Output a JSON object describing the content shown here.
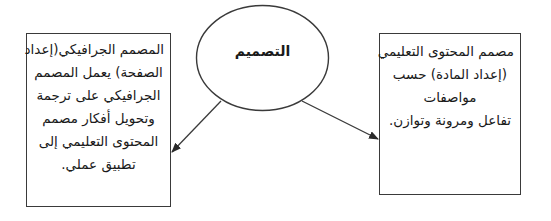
{
  "diagram": {
    "center_node": {
      "label": "التصميم",
      "shape": "ellipse"
    },
    "left_node": {
      "shape": "rectangle",
      "lines": [
        "المصمم الجرافيكي(إعداد",
        "الصفحة) يعمل المصمم",
        "الجرافيكي على ترجمة",
        "وتحويل أفكار مصمم",
        "المحتوى التعليمي إلى",
        "تطبيق عملي."
      ]
    },
    "right_node": {
      "shape": "rectangle",
      "lines": [
        "مصمم المحتوى التعليمي",
        "(إعداد المادة) حسب",
        "مواصفات",
        "تفاعل ومرونة وتوازن."
      ]
    },
    "edges": [
      {
        "from": "center_node",
        "to": "left_node",
        "type": "arrow"
      },
      {
        "from": "center_node",
        "to": "right_node",
        "type": "arrow"
      }
    ],
    "colors": {
      "stroke": "#3a3a3a",
      "background": "#ffffff",
      "text": "#1a1a1a"
    }
  }
}
